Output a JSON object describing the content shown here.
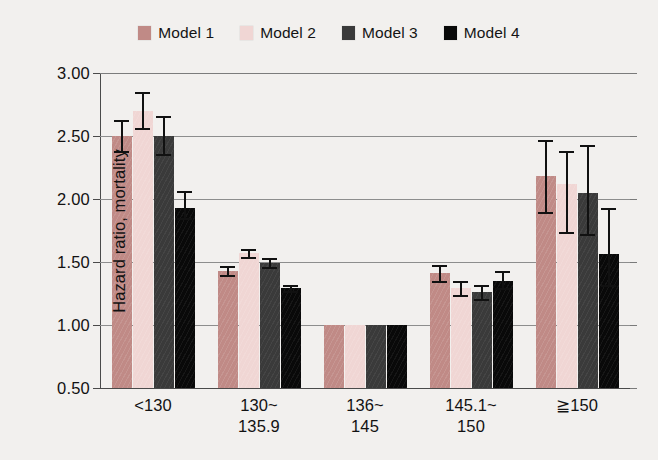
{
  "legend": {
    "items": [
      {
        "label": "Model 1",
        "color": "#c08a86"
      },
      {
        "label": "Model 2",
        "color": "#f0d6d4"
      },
      {
        "label": "Model 3",
        "color": "#3a3a3a"
      },
      {
        "label": "Model 4",
        "color": "#090909"
      }
    ]
  },
  "chart_data": {
    "type": "bar",
    "title": "",
    "xlabel": "Serum sodium(m Eq/liter)",
    "ylabel": "Hazard ratio, mortality",
    "ylim": [
      0.5,
      3.0
    ],
    "yticks": [
      "3.00",
      "2.50",
      "2.00",
      "1.50",
      "1.00",
      "0.50"
    ],
    "ytick_values": [
      3.0,
      2.5,
      2.0,
      1.5,
      1.0,
      0.5
    ],
    "grid": true,
    "legend_position": "top-center",
    "categories": [
      "<130",
      "130~135.9",
      "136~145",
      "145.1~150",
      "≧150"
    ],
    "category_lines": [
      [
        "<130",
        ""
      ],
      [
        "130~",
        "135.9"
      ],
      [
        "136~",
        "145"
      ],
      [
        "145.1~",
        "150"
      ],
      [
        "≧150",
        ""
      ]
    ],
    "reference_category": "136~145",
    "series": [
      {
        "name": "Model 1",
        "color": "#c08a86",
        "values": [
          2.5,
          1.43,
          1.0,
          1.41,
          2.18
        ],
        "ci_low": [
          2.38,
          1.4,
          null,
          1.35,
          1.9
        ],
        "ci_high": [
          2.63,
          1.47,
          null,
          1.48,
          2.47
        ]
      },
      {
        "name": "Model 2",
        "color": "#f0d6d4",
        "values": [
          2.7,
          1.57,
          1.0,
          1.29,
          2.12
        ],
        "ci_low": [
          2.56,
          1.54,
          null,
          1.24,
          1.74
        ],
        "ci_high": [
          2.85,
          1.6,
          null,
          1.35,
          2.38
        ]
      },
      {
        "name": "Model 3",
        "color": "#3a3a3a",
        "values": [
          2.5,
          1.49,
          1.0,
          1.26,
          2.05
        ],
        "ci_low": [
          2.36,
          1.46,
          null,
          1.21,
          1.72
        ],
        "ci_high": [
          2.66,
          1.53,
          null,
          1.32,
          2.43
        ]
      },
      {
        "name": "Model 4",
        "color": "#090909",
        "values": [
          1.93,
          1.29,
          1.0,
          1.35,
          1.56
        ],
        "ci_low": [
          1.85,
          1.27,
          null,
          1.29,
          1.32
        ],
        "ci_high": [
          2.06,
          1.32,
          null,
          1.43,
          1.93
        ]
      }
    ]
  }
}
